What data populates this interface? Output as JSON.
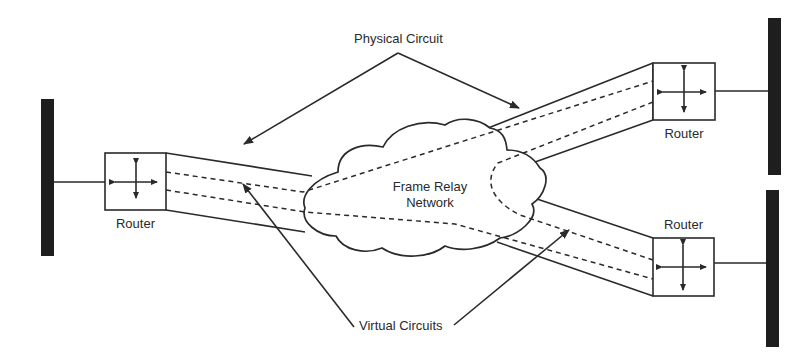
{
  "diagram": {
    "colors": {
      "stroke": "#2a2a2a",
      "bus": "#1e1e1e",
      "background": "#ffffff"
    },
    "labels": {
      "physical_circuit": "Physical Circuit",
      "virtual_circuits": "Virtual Circuits",
      "cloud_line1": "Frame Relay",
      "cloud_line2": "Network"
    },
    "routers": [
      {
        "id": "left",
        "label": "Router",
        "icon": "four-way-arrows-icon"
      },
      {
        "id": "top-right",
        "label": "Router",
        "icon": "four-way-arrows-icon"
      },
      {
        "id": "bottom-right",
        "label": "Router",
        "icon": "four-way-arrows-icon"
      }
    ],
    "networks": [
      {
        "id": "left-bus",
        "type": "LAN segment"
      },
      {
        "id": "top-right-bus",
        "type": "LAN segment"
      },
      {
        "id": "bottom-right-bus",
        "type": "LAN segment"
      }
    ],
    "links": [
      {
        "from": "left",
        "to": "top-right",
        "type": "virtual-circuit"
      },
      {
        "from": "left",
        "to": "bottom-right",
        "type": "virtual-circuit"
      },
      {
        "from": "top-right",
        "to": "bottom-right",
        "type": "virtual-circuit"
      }
    ]
  }
}
